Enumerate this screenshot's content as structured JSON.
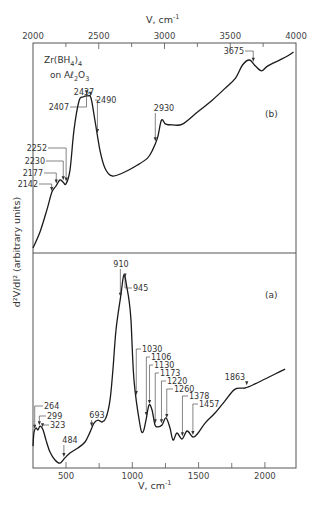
{
  "chart_data": [
    {
      "panel": "(b)",
      "type": "line",
      "title": "",
      "sample_label": [
        "Zr(BH",
        "4",
        ")",
        "4"
      ],
      "sample_label_line2": [
        "on Aℓ",
        "2",
        "O",
        "3"
      ],
      "xlabel": "V, cm⁻¹",
      "xlabel_parts": {
        "base": "V, cm",
        "sup": "-1"
      },
      "ylabel": "d²V/dI² (arbitrary units)",
      "xlim": [
        2000,
        4000
      ],
      "ylim": [
        0,
        100
      ],
      "x_axis_position": "top",
      "xticks_major": [
        2000,
        2500,
        3000,
        3500,
        4000
      ],
      "xtick_labels": [
        "2000",
        "2500",
        "3000",
        "3500",
        "4000"
      ],
      "xticks_minor": [
        2250,
        2750,
        3250,
        3750
      ],
      "series": [
        {
          "name": "Zr(BH4)4 on Al2O3, 2000-4000 cm-1",
          "x": [
            2000,
            2053,
            2106,
            2144,
            2175,
            2205,
            2228,
            2251,
            2281,
            2312,
            2350,
            2380,
            2418,
            2441,
            2471,
            2509,
            2547,
            2601,
            2681,
            2795,
            2871,
            2909,
            2947,
            2977,
            3008,
            3061,
            3137,
            3251,
            3365,
            3464,
            3540,
            3593,
            3646,
            3692,
            3738,
            3783,
            3859,
            3935,
            3981
          ],
          "y": [
            2.4,
            10.0,
            20.5,
            29.0,
            31.9,
            34.8,
            33.8,
            32.9,
            39.5,
            58.6,
            72.4,
            74.3,
            74.8,
            73.8,
            63.3,
            49.0,
            40.5,
            36.7,
            38.1,
            41.9,
            45.2,
            49.0,
            54.8,
            63.3,
            61.4,
            61.0,
            61.4,
            67.1,
            72.9,
            78.6,
            83.3,
            89.5,
            91.9,
            89.0,
            86.7,
            89.0,
            91.4,
            93.8,
            95.7
          ]
        }
      ],
      "annotations": [
        {
          "label": "2142",
          "x": 2142
        },
        {
          "label": "2177",
          "x": 2177
        },
        {
          "label": "2230",
          "x": 2230
        },
        {
          "label": "2252",
          "x": 2252
        },
        {
          "label": "2407",
          "x": 2407
        },
        {
          "label": "2437",
          "x": 2437
        },
        {
          "label": "2490",
          "x": 2490
        },
        {
          "label": "2930",
          "x": 2930
        },
        {
          "label": "3675",
          "x": 3675
        }
      ]
    },
    {
      "panel": "(a)",
      "type": "line",
      "title": "",
      "xlabel": "V, cm⁻¹",
      "xlabel_parts": {
        "base": "V, cm",
        "sup": "-1"
      },
      "ylabel": "d²V/dI² (arbitrary units)",
      "xlim": [
        250,
        2230
      ],
      "ylim": [
        0,
        100
      ],
      "x_axis_position": "bottom",
      "xticks_major": [
        500,
        1000,
        1500,
        2000
      ],
      "xtick_labels": [
        "500",
        "1000",
        "1500",
        "2000"
      ],
      "xticks_minor": [
        750,
        1250,
        1750
      ],
      "series": [
        {
          "name": "Zr(BH4)4 on Al2O3, 250-2230 cm-1",
          "x": [
            251,
            259,
            274,
            289,
            304,
            327,
            349,
            379,
            417,
            455,
            492,
            530,
            590,
            643,
            681,
            711,
            741,
            771,
            801,
            832,
            854,
            877,
            914,
            937,
            960,
            975,
            990,
            1013,
            1058,
            1081,
            1103,
            1126,
            1149,
            1171,
            1194,
            1224,
            1254,
            1284,
            1307,
            1337,
            1375,
            1413,
            1458,
            1496,
            1549,
            1624,
            1699,
            1775,
            1850,
            1926,
            2001,
            2077,
            2152
          ],
          "y": [
            10.2,
            16.7,
            18.6,
            17.7,
            19.5,
            17.7,
            13.0,
            7.4,
            3.7,
            2.3,
            4.7,
            7.0,
            9.3,
            12.1,
            16.7,
            20.9,
            22.3,
            21.4,
            23.3,
            31.6,
            45.6,
            64.2,
            80.5,
            89.8,
            83.7,
            78.1,
            68.8,
            40.9,
            20.0,
            16.7,
            22.3,
            29.3,
            26.9,
            20.0,
            19.1,
            20.0,
            23.3,
            18.6,
            13.0,
            16.3,
            13.5,
            17.2,
            14.4,
            16.3,
            20.9,
            25.6,
            31.2,
            36.7,
            37.2,
            39.1,
            41.4,
            43.7,
            46.0
          ]
        }
      ],
      "annotations": [
        {
          "label": "264",
          "x": 264
        },
        {
          "label": "299",
          "x": 299
        },
        {
          "label": "323",
          "x": 323
        },
        {
          "label": "484",
          "x": 484
        },
        {
          "label": "693",
          "x": 693
        },
        {
          "label": "910",
          "x": 910
        },
        {
          "label": "945",
          "x": 945
        },
        {
          "label": "1030",
          "x": 1030
        },
        {
          "label": "1106",
          "x": 1106
        },
        {
          "label": "1130",
          "x": 1130
        },
        {
          "label": "1173",
          "x": 1173
        },
        {
          "label": "1220",
          "x": 1220
        },
        {
          "label": "1260",
          "x": 1260
        },
        {
          "label": "1378",
          "x": 1378
        },
        {
          "label": "1457",
          "x": 1457
        },
        {
          "label": "1863",
          "x": 1863
        }
      ]
    }
  ]
}
